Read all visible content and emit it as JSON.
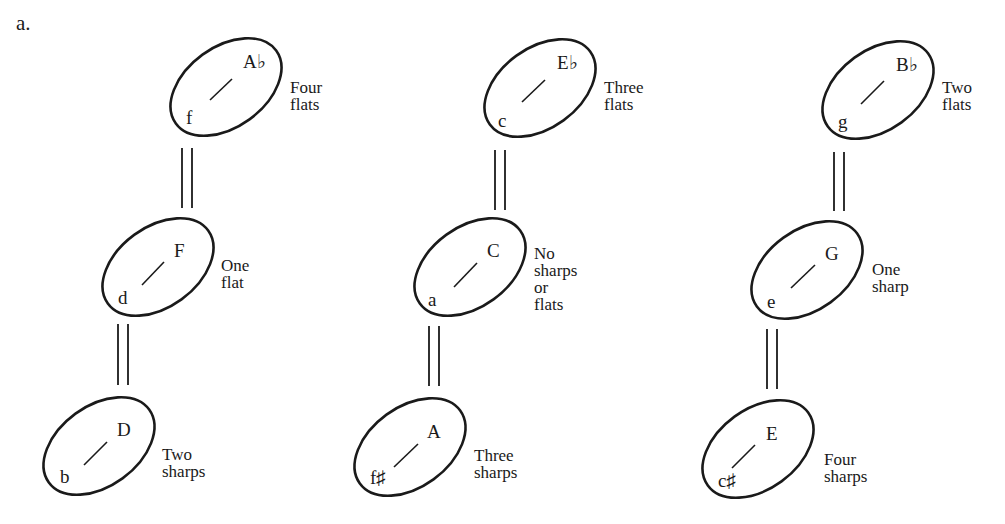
{
  "panel_label": "a.",
  "columns": [
    {
      "keys": [
        {
          "major": "A♭",
          "minor": "f",
          "signature": [
            "Four",
            "flats"
          ]
        },
        {
          "major": "F",
          "minor": "d",
          "signature": [
            "One",
            "flat"
          ]
        },
        {
          "major": "D",
          "minor": "b",
          "signature": [
            "Two",
            "sharps"
          ]
        }
      ]
    },
    {
      "keys": [
        {
          "major": "E♭",
          "minor": "c",
          "signature": [
            "Three",
            "flats"
          ]
        },
        {
          "major": "C",
          "minor": "a",
          "signature": [
            "No",
            "sharps",
            "or",
            "flats"
          ]
        },
        {
          "major": "A",
          "minor": "f♯",
          "signature": [
            "Three",
            "sharps"
          ]
        }
      ]
    },
    {
      "keys": [
        {
          "major": "B♭",
          "minor": "g",
          "signature": [
            "Two",
            "flats"
          ]
        },
        {
          "major": "G",
          "minor": "e",
          "signature": [
            "One",
            "sharp"
          ]
        },
        {
          "major": "E",
          "minor": "c♯",
          "signature": [
            "Four",
            "sharps"
          ]
        }
      ]
    }
  ],
  "style": {
    "stroke_color": "#1a1a1a",
    "background": "#ffffff"
  }
}
